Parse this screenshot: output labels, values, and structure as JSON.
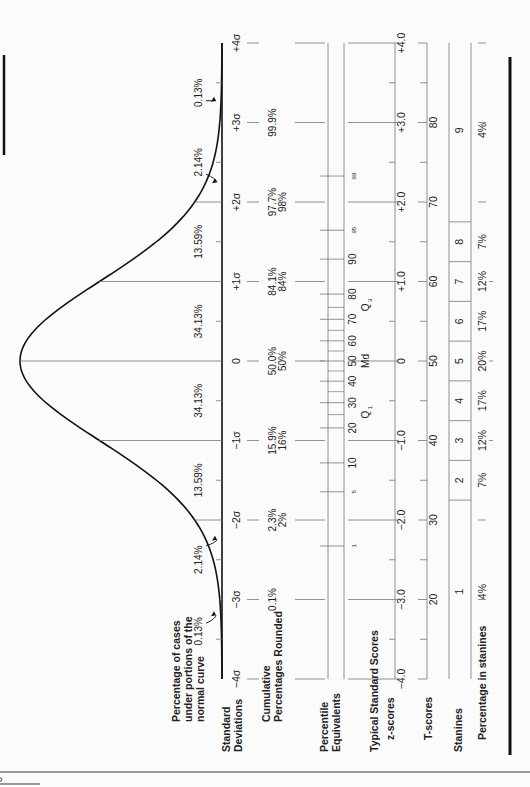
{
  "page": {
    "page_number_fragment": "o"
  },
  "chart_data": {
    "type": "line",
    "orientation": "rotated-90-ccw",
    "distribution": {
      "mean": 0,
      "sd": 1
    },
    "x_range": [
      -4,
      4
    ],
    "curve_label": "Percentage of cases under portions of the normal curve",
    "area_percentages": [
      {
        "from": -4,
        "to": -3,
        "label": "0.13%"
      },
      {
        "from": -3,
        "to": -2,
        "label": "2.14%"
      },
      {
        "from": -2,
        "to": -1,
        "label": "13.59%"
      },
      {
        "from": -1,
        "to": 0,
        "label": "34.13%"
      },
      {
        "from": 0,
        "to": 1,
        "label": "34.13%"
      },
      {
        "from": 1,
        "to": 2,
        "label": "13.59%"
      },
      {
        "from": 2,
        "to": 3,
        "label": "2.14%"
      },
      {
        "from": 3,
        "to": 4,
        "label": "0.13%"
      }
    ],
    "rows": {
      "standard_deviations": {
        "label": "Standard Deviations",
        "ticks": [
          {
            "z": -4,
            "label": "-4σ"
          },
          {
            "z": -3,
            "label": "-3σ"
          },
          {
            "z": -2,
            "label": "-2σ"
          },
          {
            "z": -1,
            "label": "-1σ"
          },
          {
            "z": 0,
            "label": "0"
          },
          {
            "z": 1,
            "label": "+1σ"
          },
          {
            "z": 2,
            "label": "+2σ"
          },
          {
            "z": 3,
            "label": "+3σ"
          },
          {
            "z": 4,
            "label": "+4σ"
          }
        ]
      },
      "cumulative_percentages": {
        "label": "Cumulative Percentages Rounded",
        "values": [
          {
            "z": -3,
            "exact": "0.1%",
            "rounded": ""
          },
          {
            "z": -2,
            "exact": "2.3%",
            "rounded": "2%"
          },
          {
            "z": -1,
            "exact": "15.9%",
            "rounded": "16%"
          },
          {
            "z": 0,
            "exact": "50.0%",
            "rounded": "50%"
          },
          {
            "z": 1,
            "exact": "84.1%",
            "rounded": "84%"
          },
          {
            "z": 2,
            "exact": "97.7%",
            "rounded": "98%"
          },
          {
            "z": 3,
            "exact": "99.9%",
            "rounded": ""
          }
        ]
      },
      "percentile_equivalents": {
        "label": "Percentile Equivalents",
        "values": [
          {
            "p": 1,
            "label": "1",
            "small": true
          },
          {
            "p": 5,
            "label": "5",
            "small": true
          },
          {
            "p": 10,
            "label": "10"
          },
          {
            "p": 20,
            "label": "20"
          },
          {
            "p": 30,
            "label": "30"
          },
          {
            "p": 40,
            "label": "40"
          },
          {
            "p": 50,
            "label": "50"
          },
          {
            "p": 60,
            "label": "60"
          },
          {
            "p": 70,
            "label": "70"
          },
          {
            "p": 80,
            "label": "80"
          },
          {
            "p": 90,
            "label": "90"
          },
          {
            "p": 95,
            "label": "95",
            "small": true
          },
          {
            "p": 99,
            "label": "99",
            "small": true
          }
        ],
        "minor_ticks": [
          25,
          35,
          45,
          55,
          65,
          75
        ],
        "markers": [
          {
            "p": 25,
            "label": "Q",
            "sub": "1"
          },
          {
            "p": 50,
            "label": "Md",
            "sub": ""
          },
          {
            "p": 75,
            "label": "Q",
            "sub": "3"
          }
        ]
      },
      "typical_standard_scores_label": "Typical Standard Scores",
      "z_scores": {
        "label": "z-scores",
        "ticks": [
          {
            "z": -4,
            "label": "-4.0"
          },
          {
            "z": -3,
            "label": "-3.0"
          },
          {
            "z": -2,
            "label": "-2.0"
          },
          {
            "z": -1,
            "label": "-1.0"
          },
          {
            "z": 0,
            "label": "0"
          },
          {
            "z": 1,
            "label": "+1.0"
          },
          {
            "z": 2,
            "label": "+2.0"
          },
          {
            "z": 3,
            "label": "+3.0"
          },
          {
            "z": 4,
            "label": "+4.0"
          }
        ]
      },
      "t_scores": {
        "label": "T-scores",
        "ticks": [
          {
            "z": -3,
            "label": "20"
          },
          {
            "z": -2,
            "label": "30"
          },
          {
            "z": -1,
            "label": "40"
          },
          {
            "z": 0,
            "label": "50"
          },
          {
            "z": 1,
            "label": "60"
          },
          {
            "z": 2,
            "label": "70"
          },
          {
            "z": 3,
            "label": "80"
          }
        ]
      },
      "stanines": {
        "label": "Stanines",
        "boundaries_z": [
          -1.75,
          -1.25,
          -0.75,
          -0.25,
          0.25,
          0.75,
          1.25,
          1.75
        ],
        "values": [
          {
            "stanine": "1",
            "pct": "4%"
          },
          {
            "stanine": "2",
            "pct": "7%"
          },
          {
            "stanine": "3",
            "pct": "12%"
          },
          {
            "stanine": "4",
            "pct": "17%"
          },
          {
            "stanine": "5",
            "pct": "20%"
          },
          {
            "stanine": "6",
            "pct": "17%"
          },
          {
            "stanine": "7",
            "pct": "12%"
          },
          {
            "stanine": "8",
            "pct": "7%"
          },
          {
            "stanine": "9",
            "pct": "4%"
          }
        ]
      },
      "percentage_in_stanines_label": "Percentage in stanines"
    }
  }
}
